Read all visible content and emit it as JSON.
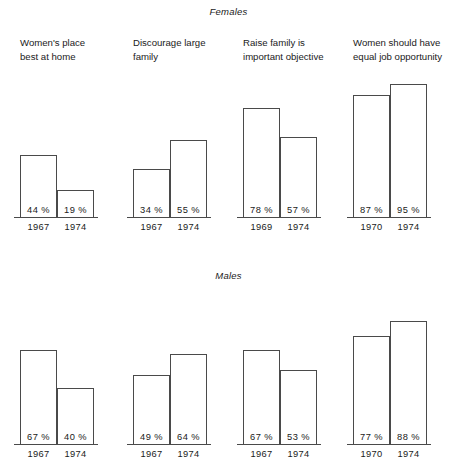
{
  "figure": {
    "panels": [
      {
        "key": "females",
        "title": "Females"
      },
      {
        "key": "males",
        "title": "Males"
      }
    ],
    "headings": [
      "Women's place\nbest at home",
      "Discourage large\nfamily",
      "Raise family is\nimportant objective",
      "Women should have\nequal job opportunity"
    ]
  },
  "chart_data": {
    "type": "bar",
    "title": "",
    "xlabel": "",
    "ylabel": "",
    "ylim": [
      0,
      100
    ],
    "grid": false,
    "legend_position": "none",
    "value_suffix": "%",
    "panels": [
      {
        "name": "Females",
        "groups": [
          {
            "category": "Women's place best at home",
            "categories": [
              "1967",
              "1974"
            ],
            "values": [
              44,
              19
            ],
            "labels": [
              "44 %",
              "19 %"
            ]
          },
          {
            "category": "Discourage large family",
            "categories": [
              "1967",
              "1974"
            ],
            "values": [
              34,
              55
            ],
            "labels": [
              "34 %",
              "55 %"
            ]
          },
          {
            "category": "Raise family is important objective",
            "categories": [
              "1969",
              "1974"
            ],
            "values": [
              78,
              57
            ],
            "labels": [
              "78 %",
              "57 %"
            ]
          },
          {
            "category": "Women should have equal job opportunity",
            "categories": [
              "1970",
              "1974"
            ],
            "values": [
              87,
              95
            ],
            "labels": [
              "87 %",
              "95 %"
            ]
          }
        ]
      },
      {
        "name": "Males",
        "groups": [
          {
            "category": "Women's place best at home",
            "categories": [
              "1967",
              "1974"
            ],
            "values": [
              67,
              40
            ],
            "labels": [
              "67 %",
              "40 %"
            ]
          },
          {
            "category": "Discourage large family",
            "categories": [
              "1967",
              "1974"
            ],
            "values": [
              49,
              64
            ],
            "labels": [
              "49 %",
              "64 %"
            ]
          },
          {
            "category": "Raise family is important objective",
            "categories": [
              "1967",
              "1974"
            ],
            "values": [
              67,
              53
            ],
            "labels": [
              "67 %",
              "53 %"
            ]
          },
          {
            "category": "Women should have equal job opportunity",
            "categories": [
              "1970",
              "1974"
            ],
            "values": [
              77,
              88
            ],
            "labels": [
              "77 %",
              "88 %"
            ]
          }
        ]
      }
    ]
  }
}
